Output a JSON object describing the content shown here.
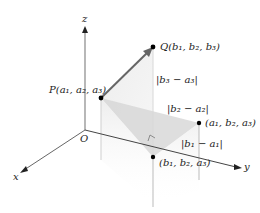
{
  "diagram": {
    "type": "3d-distance-between-points",
    "axes": {
      "x_label": "x",
      "y_label": "y",
      "z_label": "z",
      "origin_label": "O"
    },
    "points": {
      "P": {
        "label": "P(a₁, a₂, a₃)"
      },
      "Q": {
        "label": "Q(b₁, b₂, b₃)"
      },
      "corner1": {
        "label": "(a₁, b₂, a₃)"
      },
      "corner2": {
        "label": "(b₁, b₂, a₃)"
      }
    },
    "differences": {
      "dz": "|b₃ − a₃|",
      "dy": "|b₂ − a₂|",
      "dx": "|b₁ − a₁|"
    },
    "colors": {
      "axis": "#555555",
      "vector": "#666666",
      "point": "#000000",
      "shade_light": "#e6e6e6",
      "shade_dark": "#cfcfcf"
    }
  }
}
